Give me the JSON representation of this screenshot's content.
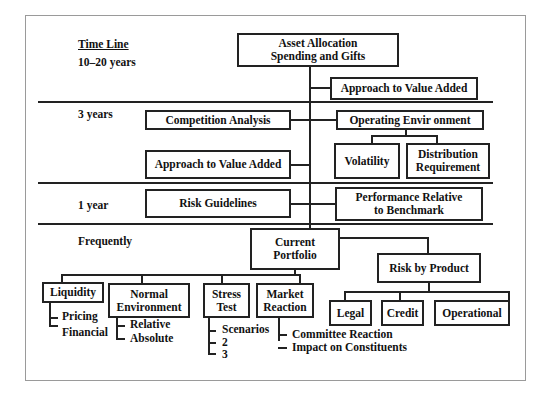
{
  "timeline": {
    "title": "Time Line",
    "rows": [
      "10–20 years",
      "3 years",
      "1 year",
      "Frequently"
    ]
  },
  "nodes": {
    "asset_allocation": "Asset Allocation\nSpending and Gifts",
    "approach_value_added_top": "Approach to Value Added",
    "competition_analysis": "Competition Analysis",
    "operating_environment": "Operating Envir  onment",
    "volatility": "Volatility",
    "distribution_requirement": "Distribution\nRequirement",
    "approach_value_added_mid": "Approach to Value Added",
    "risk_guidelines": "Risk Guidelines",
    "performance_relative": "Performance Relative\nto Benchmark",
    "current_portfolio": "Current\nPortfolio",
    "risk_by_product": "Risk by Product",
    "liquidity": "Liquidity",
    "normal_environment": "Normal\nEnvironment",
    "stress_test": "Stress\nTest",
    "market_reaction": "Market\nReaction",
    "legal": "Legal",
    "credit": "Credit",
    "operational": "Operational"
  },
  "leaves": {
    "liquidity": [
      "Pricing",
      "Financial"
    ],
    "normal_environment": [
      "Relative",
      "Absolute"
    ],
    "stress_test": [
      "Scenarios",
      "2",
      "3"
    ],
    "market_reaction": [
      "Committee Reaction",
      "Impact on Constituents"
    ]
  }
}
